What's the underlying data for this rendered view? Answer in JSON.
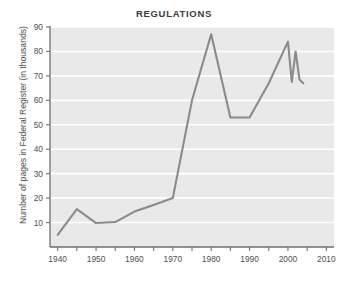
{
  "chart_data": {
    "type": "line",
    "title": "REGULATIONS",
    "xlabel": "",
    "ylabel": "Number of pages in Federal Register (in thousands)",
    "xlim": [
      1938,
      2012
    ],
    "ylim": [
      0,
      90
    ],
    "grid": true,
    "legend": false,
    "y_ticks": [
      10,
      20,
      30,
      40,
      50,
      60,
      70,
      80,
      90
    ],
    "x_ticks": [
      1940,
      1945,
      1950,
      1955,
      1960,
      1965,
      1970,
      1975,
      1980,
      1985,
      1990,
      1995,
      2000,
      2005,
      2010
    ],
    "x_tick_labels": [
      "1940",
      "",
      "1950",
      "",
      "1960",
      "",
      "1970",
      "",
      "1980",
      "",
      "1990",
      "",
      "2000",
      "",
      "2010"
    ],
    "series": [
      {
        "name": "Pages in Federal Register",
        "color": "#8b8b8b",
        "x": [
          1940,
          1945,
          1950,
          1955,
          1960,
          1965,
          1970,
          1975,
          1980,
          1985,
          1990,
          1995,
          2000,
          2001,
          2002,
          2003,
          2004
        ],
        "values": [
          5,
          15.5,
          9.8,
          10.2,
          14.5,
          17.2,
          20,
          60,
          87,
          53,
          53,
          67,
          84,
          67.5,
          80,
          68.5,
          67
        ]
      }
    ],
    "colors": {
      "plot_background": "#e9e9e9",
      "gridline": "#ffffff",
      "axis": "#6f6f6f",
      "line": "#8b8b8b",
      "text": "#4f4f4f",
      "title": "#3b3b3b",
      "page_background": "#ffffff"
    }
  }
}
